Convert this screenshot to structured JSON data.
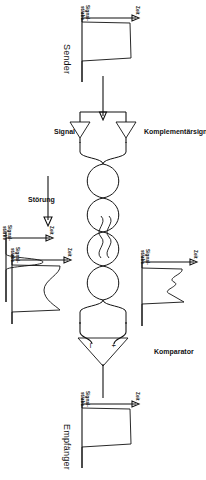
{
  "diagram": {
    "language": "de",
    "orientation": "rotated-90",
    "stroke_color": "#111111",
    "background_color": "#ffffff",
    "axis_labels": {
      "time": "Zeit",
      "amplitude_line1": "Signal-",
      "amplitude_line2": "stärke"
    },
    "stages": [
      {
        "id": "sender",
        "caption": "Sender",
        "waveform": "clean-rectangular-pulse",
        "x_axis": "Zeit",
        "y_axis": "Signalstärke"
      },
      {
        "id": "signal",
        "caption": "Signal",
        "waveform": "rectangular-pulse",
        "x_axis": "Zeit",
        "y_axis": "Signalstärke"
      },
      {
        "id": "komplementaersignal",
        "caption": "Komplementärsignal",
        "waveform": "inverted-rectangular-pulse",
        "x_axis": "Zeit",
        "y_axis": "Signalstärke"
      },
      {
        "id": "stoerung",
        "caption": "Störung",
        "waveform": "narrow-noise-spike",
        "x_axis": "Zeit",
        "y_axis": "Signalstärke"
      },
      {
        "id": "signal-gestoert",
        "caption": "",
        "waveform": "pulse-with-superimposed-noise",
        "x_axis": "Zeit",
        "y_axis": "Signalstärke"
      },
      {
        "id": "komplementaersignal-gestoert",
        "caption": "",
        "waveform": "inverted-pulse-with-noise",
        "x_axis": "Zeit",
        "y_axis": "Signalstärke"
      },
      {
        "id": "komparator",
        "caption": "Komparator",
        "symbol": "triangle-comparator",
        "inputs": [
          "+",
          "-"
        ]
      },
      {
        "id": "empfaenger",
        "caption": "Empfänger",
        "waveform": "restored-rectangular-pulse",
        "x_axis": "Zeit",
        "y_axis": "Signalstärke"
      }
    ],
    "components": {
      "cable": "twisted-pair",
      "drivers": "two-line-driver-buffers",
      "comparator_label": "Komparator",
      "comparator_plus": "+",
      "comparator_minus": "-"
    }
  }
}
